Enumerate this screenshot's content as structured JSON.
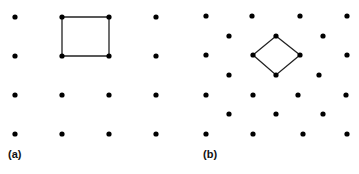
{
  "panels": [
    {
      "label": "(a)",
      "lattice": "square",
      "points": [
        [
          15,
          17
        ],
        [
          62,
          17
        ],
        [
          109,
          17
        ],
        [
          156,
          17
        ],
        [
          15,
          56
        ],
        [
          62,
          56
        ],
        [
          109,
          56
        ],
        [
          156,
          56
        ],
        [
          15,
          95
        ],
        [
          62,
          95
        ],
        [
          109,
          95
        ],
        [
          156,
          95
        ],
        [
          15,
          134
        ],
        [
          62,
          134
        ],
        [
          109,
          134
        ],
        [
          156,
          134
        ]
      ],
      "cell": [
        [
          62,
          17
        ],
        [
          109,
          17
        ],
        [
          109,
          56
        ],
        [
          62,
          56
        ]
      ]
    },
    {
      "label": "(b)",
      "lattice": "centered-rectangular",
      "points": [
        [
          206,
          16
        ],
        [
          252,
          16
        ],
        [
          300,
          16
        ],
        [
          347,
          16
        ],
        [
          229,
          36
        ],
        [
          276,
          36
        ],
        [
          323,
          36
        ],
        [
          206,
          55
        ],
        [
          253,
          55
        ],
        [
          300,
          55
        ],
        [
          347,
          55
        ],
        [
          229,
          75
        ],
        [
          276,
          75
        ],
        [
          319,
          75
        ],
        [
          206,
          95
        ],
        [
          253,
          95
        ],
        [
          298,
          95
        ],
        [
          346,
          95
        ],
        [
          229,
          114
        ],
        [
          276,
          114
        ],
        [
          323,
          114
        ],
        [
          206,
          134
        ],
        [
          253,
          134
        ],
        [
          303,
          134
        ],
        [
          347,
          134
        ]
      ],
      "cell": [
        [
          276,
          36
        ],
        [
          300,
          55
        ],
        [
          276,
          75
        ],
        [
          253,
          55
        ]
      ]
    }
  ],
  "colors": {
    "point": "#000000",
    "line": "#222222",
    "background": "#ffffff"
  }
}
